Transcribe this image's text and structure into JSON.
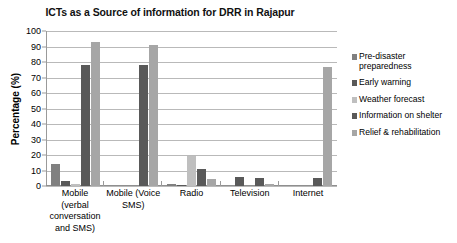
{
  "chart_data": {
    "type": "bar",
    "title": "ICTs as a Source of information for DRR in Rajapur",
    "xlabel": "",
    "ylabel": "Percentage (%)",
    "ylim": [
      0,
      100
    ],
    "ytick_step": 10,
    "yticks": [
      100,
      90,
      80,
      70,
      60,
      50,
      40,
      30,
      20,
      10,
      0
    ],
    "grid": true,
    "legend_position": "right",
    "categories": [
      "Mobile (verbal conversation and SMS)",
      "Mobile (Voice SMS)",
      "Radio",
      "Television",
      "Internet"
    ],
    "series": [
      {
        "name": "Pre-disaster preparedness",
        "color": "#808080",
        "values": [
          14,
          0,
          1,
          0,
          0
        ]
      },
      {
        "name": "Early warning",
        "color": "#595959",
        "values": [
          3,
          0,
          0.4,
          5.5,
          0
        ]
      },
      {
        "name": "Weather forecast",
        "color": "#BFBFBF",
        "values": [
          1.5,
          0,
          19.5,
          0,
          0
        ]
      },
      {
        "name": "Information on shelter",
        "color": "#595959",
        "values": [
          78,
          78,
          11,
          5,
          5
        ]
      },
      {
        "name": "Relief & rehabilitation",
        "color": "#A6A6A6",
        "values": [
          93,
          91,
          4.5,
          1.5,
          77
        ]
      }
    ],
    "series_internet_extra": {
      "name": "Relief & rehabilitation tall",
      "values": [
        77
      ]
    }
  },
  "legend": {
    "items": [
      {
        "label": "Pre-disaster preparedness",
        "color": "#808080"
      },
      {
        "label": "Early warning",
        "color": "#595959"
      },
      {
        "label": "Weather forecast",
        "color": "#BFBFBF"
      },
      {
        "label": "Information on shelter",
        "color": "#595959"
      },
      {
        "label": "Relief & rehabilitation",
        "color": "#A6A6A6"
      }
    ]
  }
}
